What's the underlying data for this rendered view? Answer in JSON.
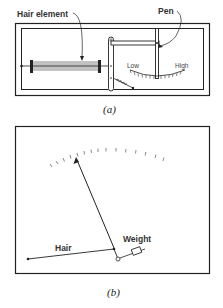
{
  "figure_a": {
    "caption": "(a)",
    "labels": {
      "hair_element": "Hair element",
      "pen": "Pen",
      "low": "Low",
      "high": "High",
      "spring": "Spr"
    }
  },
  "figure_b": {
    "caption": "(b)",
    "labels": {
      "hair": "Hair",
      "weight": "Weight"
    }
  },
  "colors": {
    "line": "#222222",
    "tick": "#555555"
  }
}
